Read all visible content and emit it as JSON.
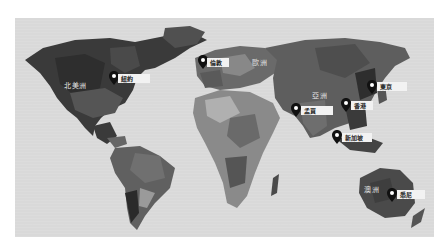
{
  "map": {
    "background": "#d9d9d9",
    "style": "low-poly grayscale world map",
    "regions": [
      {
        "id": "north-america",
        "label": "北美洲",
        "x": 64,
        "y": 80
      },
      {
        "id": "europe",
        "label": "歐洲",
        "x": 252,
        "y": 57
      },
      {
        "id": "asia",
        "label": "亞洲",
        "x": 312,
        "y": 90
      },
      {
        "id": "australia",
        "label": "澳洲",
        "x": 364,
        "y": 184
      }
    ],
    "cities": [
      {
        "id": "new-york",
        "label": "紐約",
        "pin_x": 110,
        "pin_y": 72,
        "tag_x": 118,
        "tag_y": 74,
        "tag_w": 32
      },
      {
        "id": "london",
        "label": "倫敦",
        "pin_x": 199,
        "pin_y": 55,
        "tag_x": 207,
        "tag_y": 58,
        "tag_w": 20
      },
      {
        "id": "tokyo",
        "label": "東京",
        "pin_x": 368,
        "pin_y": 80,
        "tag_x": 377,
        "tag_y": 82,
        "tag_w": 30
      },
      {
        "id": "mumbai",
        "label": "孟買",
        "pin_x": 292,
        "pin_y": 103,
        "tag_x": 301,
        "tag_y": 106,
        "tag_w": 32
      },
      {
        "id": "hong-kong",
        "label": "香港",
        "pin_x": 342,
        "pin_y": 98,
        "tag_x": 351,
        "tag_y": 101,
        "tag_w": 22
      },
      {
        "id": "singapore",
        "label": "新加坡",
        "pin_x": 333,
        "pin_y": 130,
        "tag_x": 342,
        "tag_y": 133,
        "tag_w": 30
      },
      {
        "id": "sydney",
        "label": "悉尼",
        "pin_x": 388,
        "pin_y": 188,
        "tag_x": 397,
        "tag_y": 190,
        "tag_w": 28
      }
    ]
  }
}
